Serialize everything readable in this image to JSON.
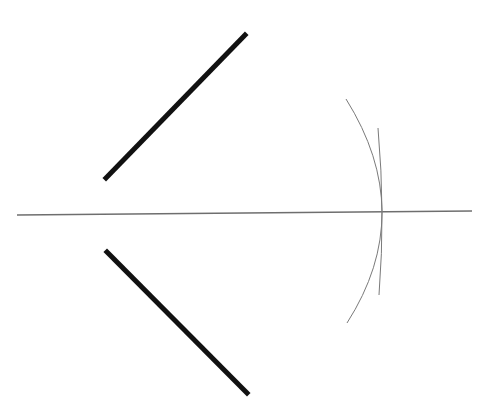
{
  "diagram": {
    "type": "geometric-construction",
    "width": 485,
    "height": 417,
    "background": "#ffffff",
    "colors": {
      "thick_line": "#111111",
      "axis_line": "#6e6e6e",
      "arc": "#7a7a7a"
    },
    "elements": {
      "upper_ray": {
        "x1": 106,
        "y1": 178,
        "x2": 245,
        "y2": 35,
        "stroke_width": 5
      },
      "lower_ray": {
        "x1": 107,
        "y1": 252,
        "x2": 247,
        "y2": 393,
        "stroke_width": 5
      },
      "horizontal_line": {
        "x1": 17,
        "y1": 215,
        "x2": 472,
        "y2": 211,
        "stroke_width": 1.5
      },
      "outer_arc": {
        "start": [
          346,
          99
        ],
        "mid": [
          382,
          212
        ],
        "end": [
          347,
          323
        ],
        "stroke_width": 1
      },
      "inner_arc": {
        "start": [
          378,
          128
        ],
        "mid": [
          382,
          212
        ],
        "end": [
          379,
          295
        ],
        "stroke_width": 1
      },
      "intersection_point": {
        "x": 382,
        "y": 212
      }
    }
  }
}
